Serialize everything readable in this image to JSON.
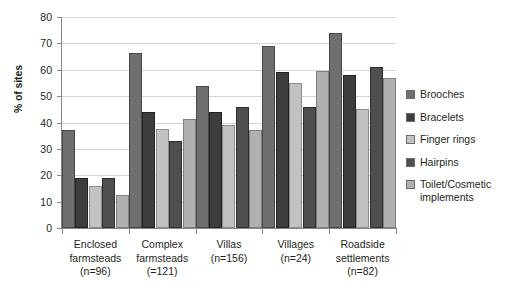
{
  "chart_data": {
    "type": "bar",
    "title": "",
    "xlabel": "",
    "ylabel": "% of sites",
    "ylim": [
      0,
      80
    ],
    "ytick_step": 10,
    "yticks": [
      80,
      70,
      60,
      50,
      40,
      30,
      20,
      10,
      0
    ],
    "grid": true,
    "legend_position": "right",
    "categories": [
      "Enclosed farmsteads (n=96)",
      "Complex farmsteads (=121)",
      "Villas (n=156)",
      "Villages (n=24)",
      "Roadside settlements (n=82)"
    ],
    "category_lines": [
      [
        "Enclosed",
        "farmsteads",
        "(n=96)"
      ],
      [
        "Complex",
        "farmsteads",
        "(=121)"
      ],
      [
        "Villas",
        "(n=156)"
      ],
      [
        "Villages",
        "(n=24)"
      ],
      [
        "Roadside",
        "settlements",
        "(n=82)"
      ]
    ],
    "series": [
      {
        "name": "Brooches",
        "color": "#6f6f6f",
        "values": [
          37,
          66.5,
          54,
          69,
          74
        ]
      },
      {
        "name": "Bracelets",
        "color": "#3d3d3d",
        "values": [
          19,
          44,
          44,
          59,
          58
        ]
      },
      {
        "name": "Finger rings",
        "color": "#c2c2c2",
        "values": [
          16,
          37.5,
          39,
          55,
          45
        ]
      },
      {
        "name": "Hairpins",
        "color": "#4f4f4f",
        "values": [
          19,
          33,
          46,
          46,
          61
        ]
      },
      {
        "name": "Toilet/Cosmetic implements",
        "color": "#b0b0b0",
        "values": [
          12.5,
          41.5,
          37,
          59.5,
          57
        ]
      }
    ]
  },
  "legend": {
    "items": [
      {
        "label": "Brooches"
      },
      {
        "label": "Bracelets"
      },
      {
        "label": "Finger rings"
      },
      {
        "label": "Hairpins"
      },
      {
        "label": "Toilet/Cosmetic implements"
      }
    ]
  }
}
